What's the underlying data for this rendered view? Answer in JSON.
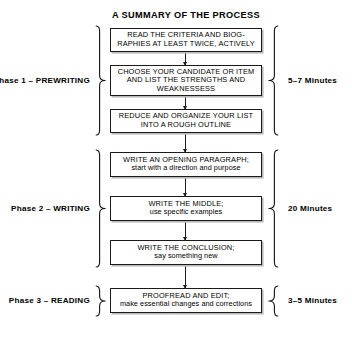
{
  "title": "A SUMMARY OF THE PROCESS",
  "phases": [
    {
      "label": "Phase 1 – PREWRITING",
      "time": "5–7 Minutes",
      "steps": [
        {
          "lines": [
            {
              "text": "READ THE CRITERIA AND BIOG-",
              "style": "caps"
            },
            {
              "text": "RAPHIES AT LEAST TWICE, ACTIVELY",
              "style": "caps"
            }
          ]
        },
        {
          "lines": [
            {
              "text": "CHOOSE YOUR CANDIDATE OR ITEM",
              "style": "caps"
            },
            {
              "text": "AND LIST THE STRENGTHS AND",
              "style": "caps"
            },
            {
              "text": "WEAKNESSESS",
              "style": "caps"
            }
          ]
        },
        {
          "lines": [
            {
              "text": "REDUCE AND ORGANIZE YOUR LIST",
              "style": "caps"
            },
            {
              "text": "INTO A ROUGH OUTLINE",
              "style": "caps"
            }
          ]
        }
      ]
    },
    {
      "label": "Phase 2 – WRITING",
      "time": "20 Minutes",
      "steps": [
        {
          "lines": [
            {
              "text": "WRITE AN OPENING PARAGRAPH;",
              "style": "caps"
            },
            {
              "text": "start with a direction and purpose",
              "style": "lower"
            }
          ]
        },
        {
          "lines": [
            {
              "text": "WRITE THE MIDDLE;",
              "style": "caps"
            },
            {
              "text": "use specific examples",
              "style": "lower"
            }
          ]
        },
        {
          "lines": [
            {
              "text": "WRITE THE CONCLUSION;",
              "style": "caps"
            },
            {
              "text": "say something new",
              "style": "lower"
            }
          ]
        }
      ]
    },
    {
      "label": "Phase 3 – READING",
      "time": "3–5 Minutes",
      "steps": [
        {
          "lines": [
            {
              "text": "PROOFREAD AND EDIT;",
              "style": "caps"
            },
            {
              "text": "make essential changes and corrections",
              "style": "lower"
            }
          ]
        }
      ]
    }
  ],
  "colors": {
    "ink": "#1a1a1a",
    "paper": "#ffffff",
    "shadow": "#b9b9b9"
  },
  "layout": {
    "boxes": [
      {
        "top": 28,
        "height": 24
      },
      {
        "top": 65,
        "height": 31
      },
      {
        "top": 109,
        "height": 24
      },
      {
        "top": 152,
        "height": 25
      },
      {
        "top": 196,
        "height": 25
      },
      {
        "top": 240,
        "height": 25
      },
      {
        "top": 288,
        "height": 25
      }
    ],
    "connectors": [
      {
        "top": 52,
        "height": 13
      },
      {
        "top": 96,
        "height": 13
      },
      {
        "top": 133,
        "height": 19
      },
      {
        "top": 177,
        "height": 19
      },
      {
        "top": 221,
        "height": 19
      },
      {
        "top": 265,
        "height": 23
      }
    ],
    "left_braces": [
      {
        "top": 25,
        "height": 111
      },
      {
        "top": 149,
        "height": 119
      },
      {
        "top": 285,
        "height": 32
      }
    ],
    "right_braces": [
      {
        "top": 25,
        "height": 111
      },
      {
        "top": 149,
        "height": 119
      },
      {
        "top": 285,
        "height": 32
      }
    ],
    "phase_label_centers": [
      80.5,
      208.5,
      301
    ],
    "time_label_centers": [
      80.5,
      208.5,
      301
    ]
  }
}
